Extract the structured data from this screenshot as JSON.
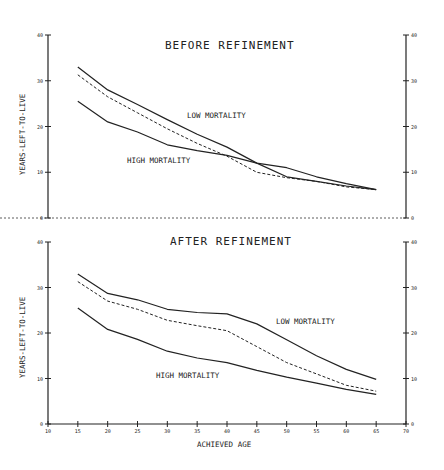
{
  "chart_data": [
    {
      "type": "line",
      "title": "BEFORE REFINEMENT",
      "xlabel": "",
      "ylabel": "YEARS-LEFT-TO-LIVE",
      "ylim": [
        0,
        40
      ],
      "yticks": [
        0,
        10,
        20,
        30,
        40
      ],
      "x": [
        15,
        20,
        25,
        30,
        35,
        40,
        45,
        50,
        55,
        60,
        65
      ],
      "series": [
        {
          "name": "LOW MORTALITY",
          "style": "solid",
          "values": [
            33,
            28,
            24.8,
            21.5,
            18.3,
            15.5,
            12,
            9,
            8,
            7,
            6.2
          ]
        },
        {
          "name": "middle (dashed)",
          "style": "dashed",
          "values": [
            31.3,
            26.5,
            23,
            19.5,
            16.3,
            13.5,
            10,
            8.8,
            8,
            6.8,
            6.2
          ]
        },
        {
          "name": "HIGH MORTALITY",
          "style": "solid",
          "values": [
            25.5,
            21,
            18.8,
            16,
            14.7,
            13.7,
            12,
            11,
            9,
            7.5,
            6.2
          ]
        }
      ],
      "annotations": [
        "LOW MORTALITY",
        "HIGH MORTALITY"
      ],
      "grid": false
    },
    {
      "type": "line",
      "title": "AFTER REFINEMENT",
      "xlabel": "ACHIEVED AGE",
      "ylabel": "YEARS-LEFT-TO-LIVE",
      "ylim": [
        0,
        40
      ],
      "xlim": [
        10,
        70
      ],
      "yticks": [
        0,
        10,
        20,
        30,
        40
      ],
      "xticks": [
        10,
        15,
        20,
        25,
        30,
        35,
        40,
        45,
        50,
        55,
        60,
        65,
        70
      ],
      "x": [
        15,
        20,
        25,
        30,
        35,
        40,
        45,
        50,
        55,
        60,
        65
      ],
      "series": [
        {
          "name": "LOW MORTALITY",
          "style": "solid",
          "values": [
            33,
            28.7,
            27.3,
            25.2,
            24.5,
            24.2,
            22,
            18.5,
            15,
            12,
            9.8
          ]
        },
        {
          "name": "middle (dashed)",
          "style": "dashed",
          "values": [
            31.3,
            27,
            25.2,
            22.8,
            21.6,
            20.5,
            17,
            13.5,
            11,
            8.5,
            7.2
          ]
        },
        {
          "name": "HIGH MORTALITY",
          "style": "solid",
          "values": [
            25.5,
            20.8,
            18.6,
            16,
            14.5,
            13.5,
            11.8,
            10.3,
            9,
            7.6,
            6.5
          ]
        }
      ],
      "annotations": [
        "LOW MORTALITY",
        "HIGH MORTALITY"
      ],
      "grid": false
    }
  ],
  "labels": {
    "top_title": "BEFORE REFINEMENT",
    "bottom_title": "AFTER REFINEMENT",
    "ylabel": "YEARS-LEFT-TO-LIVE",
    "xlabel": "ACHIEVED AGE",
    "low": "LOW MORTALITY",
    "high": "HIGH MORTALITY"
  }
}
